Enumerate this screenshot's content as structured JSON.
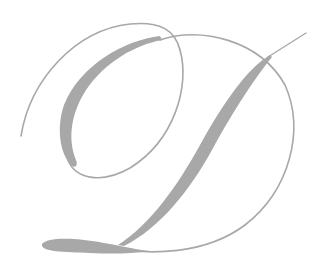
{
  "image": {
    "subject": "decorative calligraphic letter D monogram",
    "letter": "D",
    "ink_color": "#a6a6a6",
    "background_color": "#ffffff"
  }
}
